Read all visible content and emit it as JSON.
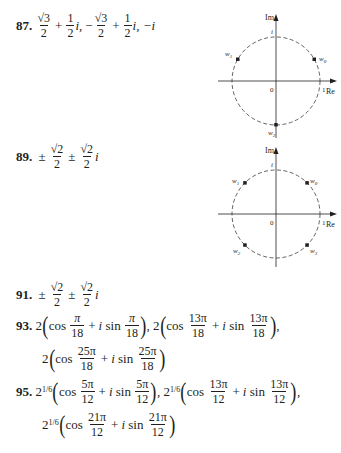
{
  "problems": [
    {
      "number": "87.",
      "answer_text": "√3/2 + 1/2 i, −√3/2 + 1/2 i, −i",
      "parts": {
        "t1_num": "√3",
        "t1_den": "2",
        "plus1": "+",
        "t2_num": "1",
        "t2_den": "2",
        "i1": "i,",
        "neg": "−",
        "t3_num": "√3",
        "t3_den": "2",
        "plus2": "+",
        "t4_num": "1",
        "t4_den": "2",
        "i2": "i,",
        "last": "−i"
      },
      "diagram": {
        "axis_x_label": "Re",
        "axis_y_label": "Im",
        "origin_label": "0",
        "unit_x_label": "1",
        "unit_y_label": "i",
        "points": [
          {
            "label": "w",
            "sub": "0",
            "angle_deg": 30
          },
          {
            "label": "w",
            "sub": "1",
            "angle_deg": 150
          },
          {
            "label": "w",
            "sub": "2",
            "angle_deg": 270
          }
        ]
      }
    },
    {
      "number": "89.",
      "answer_text": "±√2/2 ± √2/2 i",
      "parts": {
        "pm1": "±",
        "t1_num": "√2",
        "t1_den": "2",
        "pm2": "±",
        "t2_num": "√2",
        "t2_den": "2",
        "i": "i"
      },
      "diagram": {
        "axis_x_label": "Re",
        "axis_y_label": "Im",
        "origin_label": "0",
        "unit_x_label": "1",
        "unit_y_label": "i",
        "points": [
          {
            "label": "w",
            "sub": "0",
            "angle_deg": 45
          },
          {
            "label": "w",
            "sub": "1",
            "angle_deg": 135
          },
          {
            "label": "w",
            "sub": "2",
            "angle_deg": 225
          },
          {
            "label": "w",
            "sub": "3",
            "angle_deg": 315
          }
        ]
      }
    },
    {
      "number": "91.",
      "answer_text": "±√2/2 ± √2/2 i",
      "parts": {
        "pm1": "±",
        "t1_num": "√2",
        "t1_den": "2",
        "pm2": "±",
        "t2_num": "√2",
        "t2_den": "2",
        "i": "i"
      }
    },
    {
      "number": "93.",
      "answer_text": "2(cos π/18 + i sin π/18), 2(cos 13π/18 + i sin 13π/18), 2(cos 25π/18 + i sin 25π/18)",
      "coef": "2",
      "terms": [
        {
          "num": "π",
          "den": "18"
        },
        {
          "num": "13π",
          "den": "18"
        },
        {
          "num": "25π",
          "den": "18"
        }
      ]
    },
    {
      "number": "95.",
      "answer_text": "2^(1/6)(cos 5π/12 + i sin 5π/12), 2^(1/6)(cos 13π/12 + i sin 13π/12), 2^(1/6)(cos 21π/12 + i sin 21π/12)",
      "coef": "2",
      "coef_exp": "1/6",
      "terms": [
        {
          "num": "5π",
          "den": "12"
        },
        {
          "num": "13π",
          "den": "12"
        },
        {
          "num": "21π",
          "den": "12"
        }
      ]
    }
  ],
  "words": {
    "cos": "cos",
    "sin": "sin",
    "i": "i",
    "plus": "+",
    "comma": ",",
    "lparen": "(",
    "rparen": ")"
  }
}
